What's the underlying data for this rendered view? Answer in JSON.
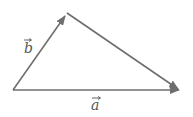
{
  "diagram": {
    "type": "vector-triangle",
    "stroke_color": "#6e6e6e",
    "vectors": [
      {
        "name": "a",
        "label": "a",
        "from": [
          13,
          90
        ],
        "to": [
          180,
          90
        ]
      },
      {
        "name": "b",
        "label": "b",
        "from": [
          13,
          90
        ],
        "to": [
          66,
          14
        ]
      }
    ],
    "edges": [
      {
        "from": [
          67,
          13
        ],
        "to": [
          180,
          90
        ],
        "arrow": true
      }
    ]
  }
}
